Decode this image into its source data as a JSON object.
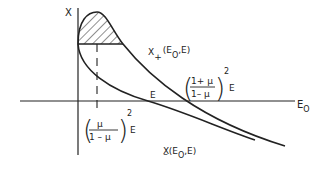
{
  "diagram": {
    "y_axis_label": "X",
    "x_axis_label": "E",
    "x_axis_subscript": "O",
    "upper_curve_label": {
      "main": "X",
      "sub": "+",
      "args": "(E",
      "args_sub": "O",
      "args_tail": ",E)"
    },
    "lower_curve_label": {
      "main": "X",
      "sub": "–",
      "args": "(E",
      "args_sub": "O",
      "args_tail": ",E)"
    },
    "intercept_label": "E",
    "upper_intercept_formula": {
      "numerator": "1+ μ",
      "denominator": "1– μ",
      "exponent": "2",
      "suffix": "E"
    },
    "lower_marker_formula": {
      "numerator": "μ",
      "denominator": "1 – μ",
      "exponent": "2",
      "suffix": "E"
    },
    "colors": {
      "ink": "#222222",
      "background": "#ffffff"
    }
  }
}
